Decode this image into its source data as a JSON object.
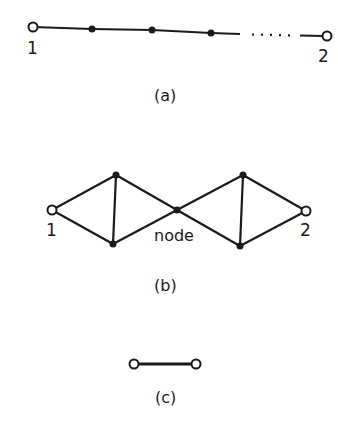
{
  "figures": [
    {
      "id": "a",
      "caption": "(a)",
      "labels": {
        "start": "1",
        "end": "2"
      },
      "description": "chain of nodes between terminals 1 and 2, with ellipsis"
    },
    {
      "id": "b",
      "caption": "(b)",
      "labels": {
        "start": "1",
        "end": "2",
        "middle": "node"
      },
      "description": "two triangular networks joined at a central node"
    },
    {
      "id": "c",
      "caption": "(c)",
      "description": "single link between two terminals"
    }
  ],
  "colors": {
    "ink": "#1a1a1a",
    "background": "#ffffff"
  }
}
